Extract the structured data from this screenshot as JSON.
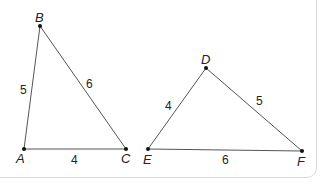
{
  "diagram": {
    "triangles": [
      {
        "name": "ABC",
        "vertices": {
          "A": [
            24,
            149
          ],
          "B": [
            40,
            26
          ],
          "C": [
            126,
            149
          ]
        },
        "labels": {
          "A": "A",
          "B": "B",
          "C": "C"
        },
        "sides": {
          "AB": "5",
          "BC": "6",
          "AC": "4"
        }
      },
      {
        "name": "DEF",
        "vertices": {
          "D": [
            206,
            68
          ],
          "E": [
            148,
            149
          ],
          "F": [
            302,
            151
          ]
        },
        "labels": {
          "D": "D",
          "E": "E",
          "F": "F"
        },
        "sides": {
          "DE": "4",
          "DF": "5",
          "EF": "6"
        }
      }
    ],
    "colors": {
      "line": "#555555",
      "text": "#222222",
      "border": "#d8d8d8"
    }
  }
}
